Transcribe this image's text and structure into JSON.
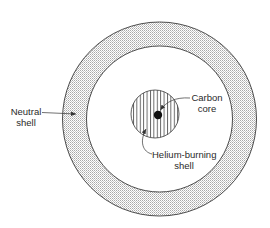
{
  "diagram": {
    "type": "concentric-shell-cross-section",
    "colors": {
      "line": "#3a3a3a",
      "stipple": "#b8b8b8",
      "background": "#ffffff",
      "core": "#111111"
    },
    "labels": {
      "neutral_shell": {
        "line1": "Neutral",
        "line2": "shell"
      },
      "carbon_core": {
        "line1": "Carbon",
        "line2": "core"
      },
      "helium_shell": {
        "line1": "Helium-burning",
        "line2": "shell"
      }
    },
    "regions": [
      {
        "name": "Neutral shell",
        "fill": "stippled",
        "outer_radius": 97,
        "inner_radius": 73
      },
      {
        "name": "Helium-burning shell",
        "fill": "vertical-hatch",
        "radius": 24
      },
      {
        "name": "Carbon core",
        "fill": "solid",
        "radius": 4
      }
    ]
  }
}
